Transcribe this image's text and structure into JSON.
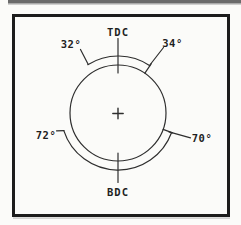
{
  "diagram": {
    "top_dead_center_label": "TDC",
    "bottom_dead_center_label": "BDC",
    "angle_labels": {
      "upper_left": "32°",
      "upper_right": "34°",
      "lower_left": "72°",
      "lower_right": "70°"
    }
  },
  "colors": {
    "background": "#fbfbf9",
    "page_bar": "#6b6b6b",
    "page_bar_shadow": "#b3b3b3",
    "frame": "#1c1c1c",
    "frame_shadow": "#c9c9c9",
    "line": "#2e2e2e",
    "text": "#1f1f1f"
  }
}
